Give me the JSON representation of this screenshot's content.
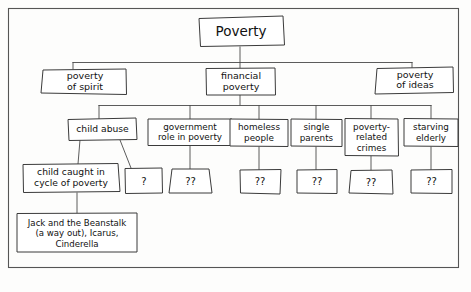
{
  "diagram": {
    "type": "hierarchical-concept-map",
    "style": "hand-drawn",
    "colors": {
      "background": "#fdfdfc",
      "box_fill": "#ffffff",
      "stroke": "#3b3b3b",
      "connector": "#4a4a4a",
      "frame": "#555555",
      "text": "#111111"
    },
    "root": {
      "label": "Poverty"
    },
    "level1": [
      {
        "id": "poverty-of-spirit",
        "line1": "poverty",
        "line2": "of spirit"
      },
      {
        "id": "financial-poverty",
        "line1": "financial",
        "line2": "poverty"
      },
      {
        "id": "poverty-of-ideas",
        "line1": "poverty",
        "line2": "of ideas"
      }
    ],
    "level2": [
      {
        "id": "child-abuse",
        "line1": "child abuse",
        "line2": "",
        "line3": ""
      },
      {
        "id": "government-role",
        "line1": "government",
        "line2": "role in poverty",
        "line3": ""
      },
      {
        "id": "homeless-people",
        "line1": "homeless",
        "line2": "people",
        "line3": ""
      },
      {
        "id": "single-parents",
        "line1": "single",
        "line2": "parents",
        "line3": ""
      },
      {
        "id": "poverty-related-crimes",
        "line1": "poverty-",
        "line2": "related",
        "line3": "crimes"
      },
      {
        "id": "starving-elderly",
        "line1": "starving",
        "line2": "elderly",
        "line3": ""
      }
    ],
    "level3": [
      {
        "id": "child-cycle",
        "line1": "child caught in",
        "line2": "cycle of poverty"
      }
    ],
    "unknowns": [
      {
        "id": "unknown-child-abuse-b",
        "label": "?"
      },
      {
        "id": "unknown-government-role",
        "label": "??"
      },
      {
        "id": "unknown-homeless-people",
        "label": "??"
      },
      {
        "id": "unknown-single-parents",
        "label": "??"
      },
      {
        "id": "unknown-poverty-related-crimes",
        "label": "??"
      },
      {
        "id": "unknown-starving-elderly",
        "label": "??"
      }
    ],
    "leaf": {
      "id": "stories",
      "line1": "Jack and the Beanstalk",
      "line2": "(a way out), Icarus,",
      "line3": "Cinderella"
    }
  }
}
